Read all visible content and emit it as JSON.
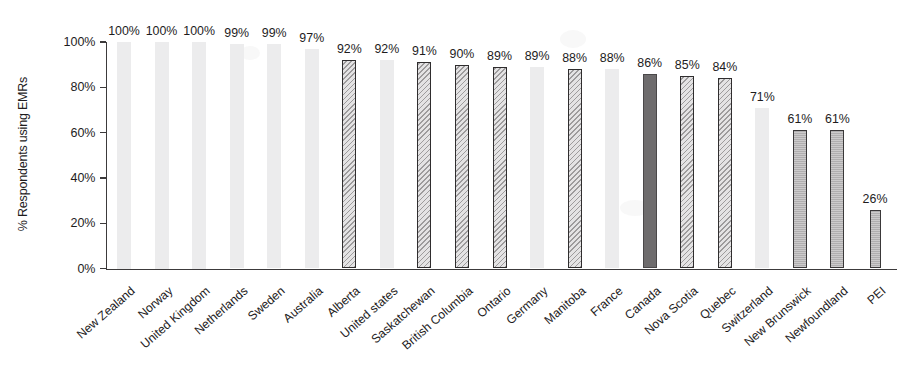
{
  "chart_data": {
    "type": "bar",
    "title": "",
    "xlabel": "",
    "ylabel": "% Respondents using EMRs",
    "ylim": [
      0,
      100
    ],
    "ytick_labels": [
      "0%",
      "20%",
      "40%",
      "60%",
      "80%",
      "100%"
    ],
    "ytick_values": [
      0,
      20,
      40,
      60,
      80,
      100
    ],
    "grid": false,
    "legend_position": "none",
    "value_label_suffix": "%",
    "categories": [
      "New Zealand",
      "Norway",
      "United Kingdom",
      "Netherlands",
      "Sweden",
      "Australia",
      "Alberta",
      "United states",
      "Saskatchewan",
      "British Columbia",
      "Ontario",
      "Germany",
      "Manitoba",
      "France",
      "Canada",
      "Nova Scotia",
      "Quebec",
      "Switzerland",
      "New Brunswick",
      "Newfoundland",
      "PEI"
    ],
    "values": [
      100,
      100,
      100,
      99,
      99,
      97,
      92,
      92,
      91,
      90,
      89,
      89,
      88,
      88,
      86,
      85,
      84,
      71,
      61,
      61,
      26
    ],
    "value_labels": [
      "100%",
      "100%",
      "100%",
      "99%",
      "99%",
      "97%",
      "92%",
      "92%",
      "91%",
      "90%",
      "89%",
      "89%",
      "88%",
      "88%",
      "86%",
      "85%",
      "84%",
      "71%",
      "61%",
      "61%",
      "26%"
    ],
    "bar_styles": [
      "plain",
      "plain",
      "plain",
      "plain",
      "plain",
      "plain",
      "hatch",
      "plain",
      "hatch",
      "hatch",
      "hatch",
      "plain",
      "hatch",
      "plain",
      "solid-dark",
      "hatch",
      "hatch",
      "plain",
      "solid-mid",
      "solid-mid",
      "solid-mid"
    ],
    "style_meanings": {
      "plain": "International jurisdiction (light grey, no border)",
      "hatch": "Canadian province (diagonal hatch, dark border)",
      "solid-dark": "Canada national average (solid dark grey)",
      "solid-mid": "Canadian province (solid mid grey, dark border)"
    },
    "colors": {
      "plain_fill": "#ececed",
      "hatch_fill": "#e4e3e4",
      "hatch_line": "#9d9b9c",
      "solid_dark_fill": "#6e6c6d",
      "solid_mid_fill": "#b6b4b5",
      "border": "#2f2d2e",
      "axis": "#3c3a3b",
      "text": "#1e1c1d"
    }
  }
}
